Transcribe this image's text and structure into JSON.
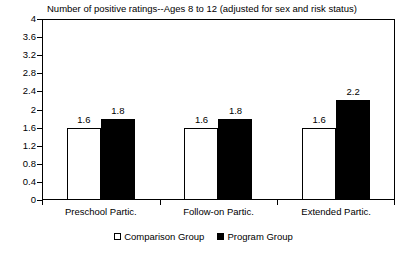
{
  "chart_data": {
    "type": "bar",
    "title": "Number of positive ratings--Ages 8 to 12 (adjusted for sex and risk status)",
    "xlabel": "",
    "ylabel": "",
    "ylim": [
      0,
      4
    ],
    "ytick_step": 0.4,
    "grid": false,
    "legend_position": "bottom-center",
    "categories": [
      "Preschool Partic.",
      "Follow-on Partic.",
      "Extended Partic."
    ],
    "yticks": [
      "4",
      "3.6",
      "3.2",
      "2.8",
      "2.4",
      "2",
      "1.6",
      "1.2",
      "0.8",
      "0.4",
      "0"
    ],
    "series": [
      {
        "name": "Comparison Group",
        "color": "#ffffff",
        "values": [
          1.6,
          1.6,
          1.6
        ],
        "labels": [
          "1.6",
          "1.6",
          "1.6"
        ]
      },
      {
        "name": "Program Group",
        "color": "#000000",
        "values": [
          1.8,
          1.8,
          2.2
        ],
        "labels": [
          "1.8",
          "1.8",
          "2.2"
        ]
      }
    ]
  },
  "legend": {
    "items": [
      {
        "label": "Comparison Group",
        "swatch": "hollow"
      },
      {
        "label": "Program Group",
        "swatch": "filled"
      }
    ]
  }
}
